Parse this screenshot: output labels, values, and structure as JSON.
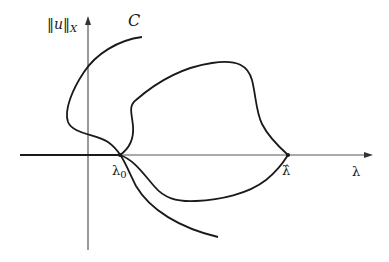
{
  "figure": {
    "type": "bifurcation-diagram",
    "y_axis_label": {
      "norm_open": "‖",
      "var": "u",
      "norm_close": "‖",
      "subscript": "X"
    },
    "x_axis_label": "λ",
    "curve_label": "C",
    "points": {
      "lambda0": {
        "symbol": "λ",
        "subscript": "0"
      },
      "lambda_hat": {
        "symbol": "λ̂"
      }
    },
    "colors": {
      "curve": "#1a1a1a",
      "axis": "#555555",
      "background": "#ffffff"
    }
  }
}
